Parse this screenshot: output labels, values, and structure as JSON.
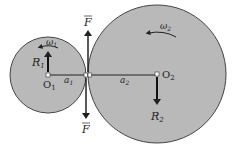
{
  "diagram": {
    "title": "",
    "colors": {
      "gear_fill": "#b9b9b9",
      "gear_stroke": "#444444",
      "line": "#222222",
      "background": "#ffffff"
    },
    "gear1": {
      "center_label": "O",
      "center_sub": "1",
      "omega_label": "ω",
      "omega_sub": "1",
      "reaction_label": "R",
      "reaction_sub": "1",
      "radius_label": "a",
      "radius_sub": "1"
    },
    "gear2": {
      "center_label": "O",
      "center_sub": "2",
      "omega_label": "ω",
      "omega_sub": "2",
      "reaction_label": "R",
      "reaction_sub": "2",
      "radius_label": "a",
      "radius_sub": "2"
    },
    "force_top_label": "F",
    "force_bottom_label": "F"
  }
}
